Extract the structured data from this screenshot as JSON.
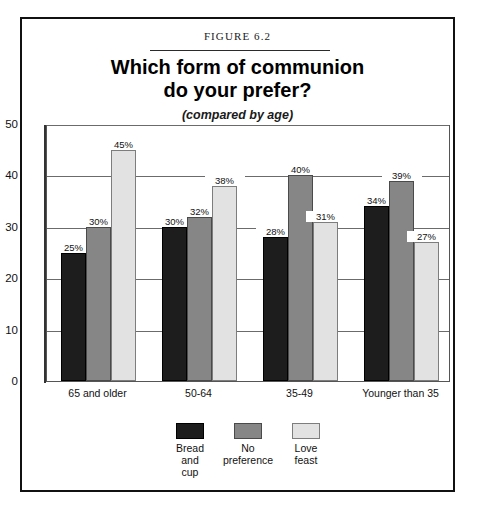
{
  "figure": {
    "number_label": "FIGURE 6.2",
    "title_line1": "Which form of communion",
    "title_line2": "do your prefer?",
    "subtitle": "(compared by age)"
  },
  "chart_data": {
    "type": "bar",
    "title": "Which form of communion do your prefer?",
    "subtitle": "(compared by age)",
    "xlabel": "",
    "ylabel": "",
    "ylim": [
      0,
      50
    ],
    "yticks": [
      0,
      10,
      20,
      30,
      40,
      50
    ],
    "ytick_labels": [
      "0",
      "10",
      "20",
      "30",
      "40",
      "50"
    ],
    "grid": true,
    "legend_position": "bottom-center",
    "categories": [
      "65 and older",
      "50-64",
      "35-49",
      "Younger than 35"
    ],
    "series": [
      {
        "name": "Bread and cup",
        "legend_label": "Bread\nand\ncup",
        "color": "#1d1d1d",
        "values": [
          25,
          30,
          28,
          34
        ],
        "data_labels": [
          "25%",
          "30%",
          "28%",
          "34%"
        ]
      },
      {
        "name": "No preference",
        "legend_label": "No\npreference",
        "color": "#868686",
        "values": [
          30,
          32,
          40,
          39
        ],
        "data_labels": [
          "30%",
          "32%",
          "40%",
          "39%"
        ]
      },
      {
        "name": "Love feast",
        "legend_label": "Love\nfeast",
        "color": "#e2e2e2",
        "values": [
          45,
          38,
          31,
          27
        ],
        "data_labels": [
          "45%",
          "38%",
          "31%",
          "27%"
        ]
      }
    ]
  }
}
